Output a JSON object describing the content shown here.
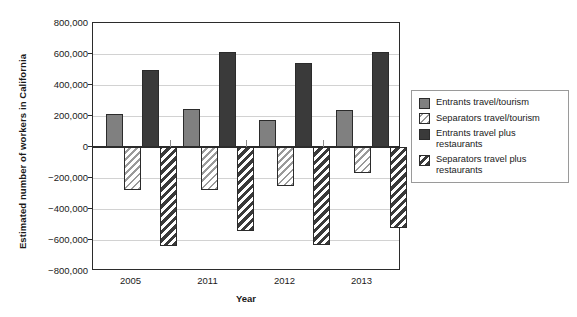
{
  "chart_data": {
    "type": "bar",
    "title": "",
    "xlabel": "Year",
    "ylabel": "Estimated number of workers in California",
    "categories": [
      "2005",
      "2011",
      "2012",
      "2013"
    ],
    "ylim": [
      -800000,
      800000
    ],
    "ytick_values": [
      800000,
      600000,
      400000,
      200000,
      0,
      -200000,
      -400000,
      -600000,
      -800000
    ],
    "ytick_labels": [
      "800,000",
      "600,000",
      "400,000",
      "200,000",
      "0",
      "−200,000",
      "−400,000",
      "−600,000",
      "−800,000"
    ],
    "grid": true,
    "legend_position": "right",
    "series": [
      {
        "name": "Entrants travel/tourism",
        "style": "solid-light",
        "color": "#808080",
        "values": [
          215000,
          245000,
          175000,
          240000
        ]
      },
      {
        "name": "Separators travel/tourism",
        "style": "hatch-light",
        "color": "#9a9a9a",
        "values": [
          -275000,
          -280000,
          -250000,
          -170000
        ]
      },
      {
        "name": "Entrants travel plus restaurants",
        "style": "solid-dark",
        "color": "#3a3a3a",
        "values": [
          500000,
          610000,
          540000,
          615000
        ]
      },
      {
        "name": "Separators travel plus restaurants",
        "style": "hatch-dark",
        "color": "#3a3a3a",
        "values": [
          -640000,
          -545000,
          -635000,
          -525000
        ]
      }
    ]
  },
  "legend": {
    "items": [
      {
        "label": "Entrants travel/tourism"
      },
      {
        "label": "Separators travel/tourism"
      },
      {
        "label": "Entrants travel plus restaurants"
      },
      {
        "label": "Separators travel plus restaurants"
      }
    ]
  }
}
